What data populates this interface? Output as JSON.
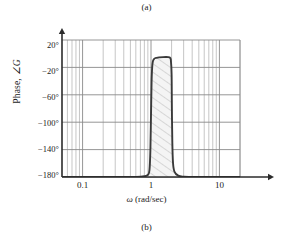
{
  "captions": {
    "top": "(a)",
    "bottom": "(b)"
  },
  "axes": {
    "ylabel_prefix": "Phase, ",
    "ylabel_symbol": "∠G",
    "xlabel_symbol": "ω",
    "xlabel_units": " (rad/sec)",
    "y_ticks": [
      "20°",
      "−20°",
      "−60°",
      "−100°",
      "−140°",
      "−180°"
    ],
    "x_ticks": [
      "0.1",
      "1",
      "10"
    ]
  },
  "colors": {
    "curve": "#3a3a3a",
    "major_grid": "#8a8a8a",
    "minor_grid": "#b8b8b8",
    "axis": "#2b2b2b",
    "hatch": "#b5b5b5",
    "fill": "#f2f2f2",
    "text": "#1a1a1a"
  },
  "chart_data": {
    "type": "line",
    "title": "",
    "subtitle": "",
    "xlabel": "ω (rad/sec)",
    "ylabel": "Phase, ∠G",
    "xscale": "log",
    "yscale": "linear",
    "xlim": [
      0.05,
      20
    ],
    "ylim": [
      -180,
      20
    ],
    "xticks": [
      0.1,
      1,
      10
    ],
    "xticklabels": [
      "0.1",
      "1",
      "10"
    ],
    "yticks": [
      20,
      -20,
      -60,
      -100,
      -140,
      -180
    ],
    "yticklabels": [
      "20°",
      "−20°",
      "−60°",
      "−100°",
      "−140°",
      "−180°"
    ],
    "grid": "both-log-minor",
    "legend": "none",
    "annotations": [
      {
        "text": "hatched band under phase pulse",
        "x_range": [
          1.0,
          2.05
        ],
        "y_range": [
          -180,
          -5
        ]
      }
    ],
    "series": [
      {
        "name": "Phase of G",
        "comment": "phase is -180 deg everywhere except a narrow pulse rising to about -5 deg between w=1 and w=2 rad/sec",
        "x": [
          0.05,
          0.1,
          0.2,
          0.4,
          0.6,
          0.8,
          0.9,
          0.95,
          0.98,
          1.0,
          1.02,
          1.05,
          1.1,
          1.2,
          1.5,
          1.8,
          1.9,
          1.95,
          2.0,
          2.02,
          2.05,
          2.1,
          2.2,
          2.5,
          3.0,
          5.0,
          10.0,
          20.0
        ],
        "y": [
          -180,
          -180,
          -180,
          -180,
          -180,
          -179,
          -177,
          -170,
          -140,
          -90,
          -40,
          -15,
          -8,
          -6,
          -5,
          -5,
          -6,
          -9,
          -30,
          -80,
          -130,
          -160,
          -172,
          -178,
          -179.5,
          -180,
          -180,
          -180
        ]
      }
    ]
  },
  "gridlines": {
    "x_major_decades": [
      0.1,
      1,
      10
    ],
    "x_minor": [
      0.06,
      0.07,
      0.08,
      0.09,
      0.2,
      0.3,
      0.4,
      0.5,
      0.6,
      0.7,
      0.8,
      0.9,
      2,
      3,
      4,
      5,
      6,
      7,
      8,
      9,
      20
    ],
    "y_major": [
      20,
      -20,
      -60,
      -100,
      -140,
      -180
    ]
  }
}
